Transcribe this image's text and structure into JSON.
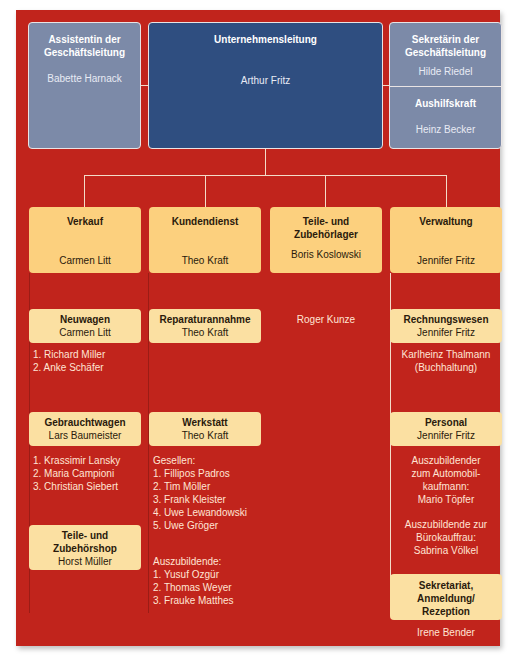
{
  "top": {
    "assistant": {
      "title": "Assistentin der Geschäftsleitung",
      "name": "Babette Harnack"
    },
    "management": {
      "title": "Unternehmensleitung",
      "name": "Arthur Fritz"
    },
    "secretary": {
      "title": "Sekretärin der Geschäftsleitung",
      "name": "Hilde Riedel"
    },
    "temp": {
      "title": "Aushilfskraft",
      "name": "Heinz Becker"
    }
  },
  "departments": {
    "sales": {
      "title": "Verkauf",
      "name": "Carmen Litt",
      "new_cars": {
        "title": "Neuwagen",
        "name": "Carmen Litt",
        "staff": [
          "1. Richard Miller",
          "2. Anke Schäfer"
        ]
      },
      "used_cars": {
        "title": "Gebrauchtwagen",
        "name": "Lars Baumeister",
        "staff": [
          "1. Krassimir Lansky",
          "2. Maria Campioni",
          "3. Christian Siebert"
        ]
      },
      "parts_shop": {
        "title_line1": "Teile- und",
        "title_line2": "Zubehörshop",
        "name": "Horst Müller"
      }
    },
    "service": {
      "title": "Kundendienst",
      "name": "Theo Kraft",
      "reception": {
        "title": "Reparaturannahme",
        "name": "Theo Kraft"
      },
      "workshop": {
        "title": "Werkstatt",
        "name": "Theo Kraft",
        "journeymen_label": "Gesellen:",
        "journeymen": [
          "1. Fillipos Padros",
          "2. Tim Möller",
          "3. Frank Kleister",
          "4. Uwe Lewandowski",
          "5. Uwe Gröger"
        ],
        "apprentices_label": "Auszubildende:",
        "apprentices": [
          "1. Yusuf Ozgür",
          "2. Thomas Weyer",
          "3. Frauke Matthes"
        ]
      }
    },
    "parts_warehouse": {
      "title_line1": "Teile- und",
      "title_line2": "Zubehörlager",
      "name": "Boris Koslowski",
      "staff": [
        "Roger Kunze"
      ]
    },
    "administration": {
      "title": "Verwaltung",
      "name": "Jennifer Fritz",
      "accounting": {
        "title": "Rechnungswesen",
        "name": "Jennifer Fritz",
        "staff_line1": "Karlheinz Thalmann",
        "staff_line2": "(Buchhaltung)"
      },
      "hr": {
        "title": "Personal",
        "name": "Jennifer Fritz",
        "apprentice1": [
          "Auszubildender",
          "zum Automobil-",
          "kaufmann:",
          "Mario Töpfer"
        ],
        "apprentice2": [
          "Auszubildende zur",
          "Bürokauffrau:",
          "Sabrina Völkel"
        ]
      },
      "secretariat": {
        "title_lines": [
          "Sekretariat,",
          "Anmeldung/",
          "Rezeption"
        ],
        "name": "Irene Bender"
      }
    }
  },
  "colors": {
    "background": "#c1241c",
    "grey_box": "#7c8aa8",
    "navy_box": "#2f4e80",
    "dept_box": "#fcd07e",
    "sub_box": "#fbe0a2"
  }
}
